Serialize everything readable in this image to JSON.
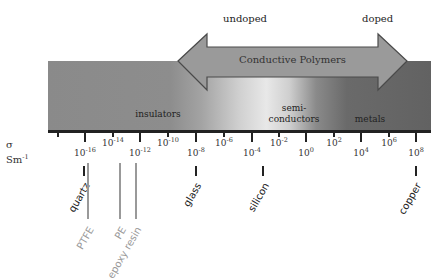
{
  "diagram": {
    "title_arrow": "Conductive Polymers",
    "arrow_left_label": "undoped",
    "arrow_right_label": "doped",
    "regions": [
      {
        "label": "insulators",
        "x": 160,
        "y": 114
      },
      {
        "label": "semi-",
        "label2": "conductors",
        "x": 294,
        "y": 103
      },
      {
        "label": "metals",
        "x": 370,
        "y": 114
      }
    ],
    "axis": {
      "quantity": "σ",
      "units_base": "Sm",
      "units_exp": "-1",
      "ticks": [
        {
          "exp": "-18",
          "x": 58,
          "major": false,
          "label": false
        },
        {
          "exp": "-16",
          "x": 85,
          "major": true,
          "label": true
        },
        {
          "exp": "-14",
          "x": 113,
          "major": false,
          "label": true
        },
        {
          "exp": "-12",
          "x": 140,
          "major": true,
          "label": true
        },
        {
          "exp": "-10",
          "x": 168,
          "major": false,
          "label": true
        },
        {
          "exp": "-8",
          "x": 196,
          "major": true,
          "label": true
        },
        {
          "exp": "-6",
          "x": 224,
          "major": false,
          "label": true
        },
        {
          "exp": "-4",
          "x": 252,
          "major": true,
          "label": true
        },
        {
          "exp": "-2",
          "x": 279,
          "major": false,
          "label": true
        },
        {
          "exp": "0",
          "x": 306,
          "major": true,
          "label": true
        },
        {
          "exp": "2",
          "x": 334,
          "major": false,
          "label": true
        },
        {
          "exp": "4",
          "x": 361,
          "major": true,
          "label": true
        },
        {
          "exp": "6",
          "x": 389,
          "major": false,
          "label": true
        },
        {
          "exp": "8",
          "x": 416,
          "major": true,
          "label": true
        }
      ]
    },
    "materials": [
      {
        "name": "quartz",
        "x": 84,
        "tone": "dark"
      },
      {
        "name": "glass",
        "x": 196,
        "tone": "dark"
      },
      {
        "name": "silicon",
        "x": 263,
        "tone": "dark"
      },
      {
        "name": "copper",
        "x": 416,
        "tone": "dark"
      },
      {
        "name": "PTFE",
        "x": 88,
        "tone": "light"
      },
      {
        "name": "PE",
        "x": 120,
        "tone": "light"
      },
      {
        "name": "epoxy resin",
        "x": 136,
        "tone": "light"
      }
    ],
    "colors": {
      "arrow_fill": "#9a9a9a",
      "arrow_stroke": "#4a4a4a",
      "axis": "#222222",
      "light_label": "#999999"
    }
  }
}
